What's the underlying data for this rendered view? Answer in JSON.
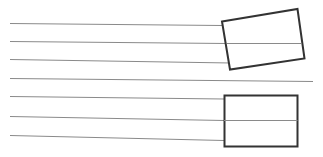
{
  "figure": {
    "title": "",
    "background_color": "#ffffff",
    "width": 323,
    "height": 157
  },
  "chart_data": {
    "type": "scatter",
    "title": "",
    "xlabel": "",
    "ylabel": "",
    "xlim": [
      0,
      323
    ],
    "ylim": [
      0,
      157
    ],
    "grid": false,
    "legend": "none",
    "annotations": []
  },
  "style": {
    "line_color": "#8a8a8a",
    "line_width": 1,
    "rect_stroke_color": "#333333",
    "rect_stroke_width": 2,
    "rect_fill": "#ffffff"
  },
  "lines": [
    {
      "name": "line-1",
      "x1": 10,
      "y1": 23.5,
      "x2": 222,
      "y2": 25.5
    },
    {
      "name": "line-2",
      "x1": 10,
      "y1": 41.5,
      "x2": 227,
      "y2": 43.5
    },
    {
      "name": "line-3",
      "x1": 10,
      "y1": 59.5,
      "x2": 231,
      "y2": 63.0
    },
    {
      "name": "line-4",
      "x1": 10,
      "y1": 78.5,
      "x2": 313,
      "y2": 81.5
    },
    {
      "name": "line-5",
      "x1": 10,
      "y1": 96.5,
      "x2": 224,
      "y2": 99.0
    },
    {
      "name": "line-6",
      "x1": 10,
      "y1": 116.5,
      "x2": 224,
      "y2": 120.5
    },
    {
      "name": "line-7",
      "x1": 10,
      "y1": 135.5,
      "x2": 224,
      "y2": 140.5
    }
  ],
  "rectangles": [
    {
      "name": "rotated-rectangle",
      "rotation_deg": -12,
      "corners": [
        {
          "x": 222.0,
          "y": 21.5
        },
        {
          "x": 297.5,
          "y": 9.0
        },
        {
          "x": 304.5,
          "y": 58.5
        },
        {
          "x": 230.0,
          "y": 69.5
        }
      ]
    },
    {
      "name": "axis-aligned-rectangle",
      "rotation_deg": 0,
      "corners": [
        {
          "x": 224.5,
          "y": 95.5
        },
        {
          "x": 297.5,
          "y": 95.5
        },
        {
          "x": 297.5,
          "y": 146.5
        },
        {
          "x": 224.5,
          "y": 146.5
        }
      ]
    }
  ],
  "line_segments_over_rect": [
    {
      "name": "line-2-overlay",
      "x1": 227,
      "y1": 43.5,
      "x2": 301,
      "y2": 43.5
    },
    {
      "name": "line-6-overlay",
      "x1": 224,
      "y1": 120.5,
      "x2": 297.5,
      "y2": 120.5
    }
  ]
}
